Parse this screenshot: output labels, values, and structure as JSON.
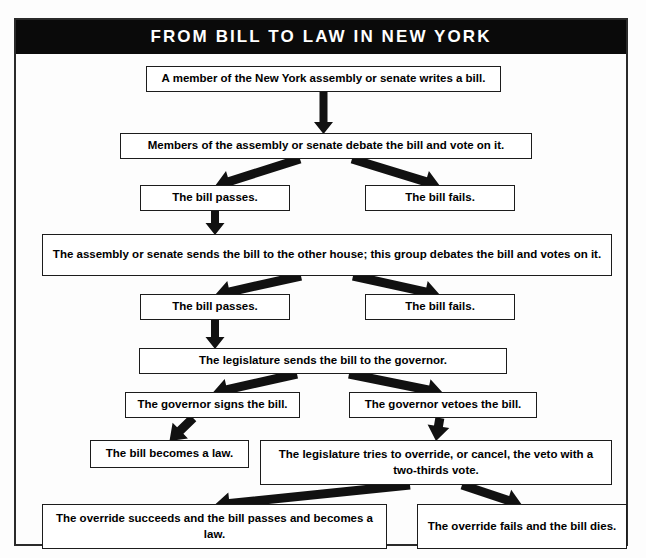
{
  "poster": {
    "title": "FROM BILL TO LAW IN NEW YORK",
    "frame_color": "#2a2a2a",
    "title_bg": "#0a0a0a",
    "title_fg": "#ffffff",
    "box_border": "#1c1c1c",
    "background": "#fdfdfd"
  },
  "chart_data": {
    "type": "diagram",
    "title": "FROM BILL TO LAW IN NEW YORK",
    "orientation": "top-down",
    "nodes": [
      {
        "id": "n1",
        "text": "A member of the New York assembly or senate writes a bill.",
        "x": 130,
        "y": 12,
        "w": 355,
        "h": 26
      },
      {
        "id": "n2",
        "text": "Members of the assembly or senate debate the bill and vote on it.",
        "x": 104,
        "y": 79,
        "w": 412,
        "h": 26
      },
      {
        "id": "n3",
        "text": "The bill passes.",
        "x": 124,
        "y": 131,
        "w": 150,
        "h": 26
      },
      {
        "id": "n4",
        "text": "The bill fails.",
        "x": 349,
        "y": 131,
        "w": 150,
        "h": 26
      },
      {
        "id": "n5",
        "text": "The assembly or senate sends the bill to the other house; this group debates the bill and votes on it.",
        "x": 26,
        "y": 180,
        "w": 570,
        "h": 42
      },
      {
        "id": "n6",
        "text": "The bill passes.",
        "x": 124,
        "y": 240,
        "w": 150,
        "h": 26
      },
      {
        "id": "n7",
        "text": "The bill fails.",
        "x": 349,
        "y": 240,
        "w": 150,
        "h": 26
      },
      {
        "id": "n8",
        "text": "The legislature sends the bill to the governor.",
        "x": 123,
        "y": 294,
        "w": 368,
        "h": 26
      },
      {
        "id": "n9",
        "text": "The governor signs the bill.",
        "x": 109,
        "y": 338,
        "w": 175,
        "h": 26
      },
      {
        "id": "n10",
        "text": "The governor vetoes the bill.",
        "x": 333,
        "y": 338,
        "w": 188,
        "h": 26
      },
      {
        "id": "n11",
        "text": "The bill becomes a law.",
        "x": 74,
        "y": 386,
        "w": 159,
        "h": 28
      },
      {
        "id": "n12",
        "text": "The legislature tries to override, or cancel, the veto with a two-thirds vote.",
        "x": 244,
        "y": 386,
        "w": 352,
        "h": 45
      },
      {
        "id": "n13",
        "text": "The override succeeds and the bill passes and becomes a law.",
        "x": 26,
        "y": 450,
        "w": 345,
        "h": 45
      },
      {
        "id": "n14",
        "text": "The override fails and the bill dies.",
        "x": 401,
        "y": 450,
        "w": 210,
        "h": 45
      }
    ],
    "edges": [
      {
        "from": "n1",
        "to": "n2",
        "style": "straight-down"
      },
      {
        "from": "n2",
        "to": "n3",
        "style": "diagonal-down-left"
      },
      {
        "from": "n2",
        "to": "n4",
        "style": "diagonal-down-right"
      },
      {
        "from": "n3",
        "to": "n5",
        "style": "straight-down"
      },
      {
        "from": "n5",
        "to": "n6",
        "style": "diagonal-down-left"
      },
      {
        "from": "n5",
        "to": "n7",
        "style": "diagonal-down-right"
      },
      {
        "from": "n6",
        "to": "n8",
        "style": "straight-down"
      },
      {
        "from": "n8",
        "to": "n9",
        "style": "diagonal-down-left"
      },
      {
        "from": "n8",
        "to": "n10",
        "style": "diagonal-down-right"
      },
      {
        "from": "n9",
        "to": "n11",
        "style": "diagonal-down-left"
      },
      {
        "from": "n10",
        "to": "n12",
        "style": "diagonal-down-right"
      },
      {
        "from": "n12",
        "to": "n13",
        "style": "diagonal-down-left"
      },
      {
        "from": "n12",
        "to": "n14",
        "style": "diagonal-down-right"
      }
    ]
  }
}
